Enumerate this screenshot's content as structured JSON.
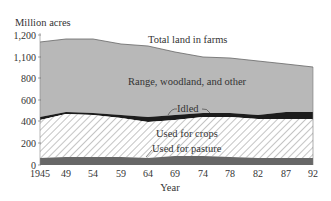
{
  "chart_data": {
    "type": "area",
    "stacked": true,
    "title": "",
    "ylabel": "Million acres",
    "xlabel": "Year",
    "x": [
      "1945",
      "49",
      "54",
      "59",
      "64",
      "69",
      "74",
      "78",
      "82",
      "87",
      "92"
    ],
    "yticks": [
      "0",
      "200",
      "400",
      "600",
      "800",
      "1,100",
      "1,200"
    ],
    "ylim": [
      0,
      1200
    ],
    "axis_note": "y-axis tick spacing is uniform although labels jump from 800 to 1,100",
    "series": [
      {
        "name": "Used for pasture",
        "values": [
          60,
          70,
          70,
          68,
          65,
          75,
          75,
          68,
          65,
          65,
          65
        ],
        "color": "#666666"
      },
      {
        "name": "Used for crops",
        "values": [
          360,
          400,
          395,
          385,
          370,
          365,
          370,
          395,
          380,
          340,
          345
        ],
        "color": "hatch"
      },
      {
        "name": "Idled",
        "values": [
          25,
          15,
          20,
          25,
          35,
          35,
          20,
          15,
          25,
          50,
          45
        ],
        "color": "#1a1a1a"
      },
      {
        "name": "Range, woodland, and other",
        "values": [
          0,
          0,
          0,
          0,
          0,
          0,
          0,
          0,
          0,
          0,
          0
        ],
        "color": "#b5b5b5"
      }
    ],
    "total_land_in_farms": [
      1165,
      1185,
      1185,
      1160,
      1150,
      1110,
      1080,
      1075,
      1050,
      1030,
      1000
    ],
    "annotations": [
      "Total land in farms",
      "Range, woodland, and other",
      "Idled",
      "Used for crops",
      "Used for pasture"
    ],
    "legend": "inline labels",
    "grid": false
  },
  "labels": {
    "ylabel": "Million acres",
    "xlabel": "Year",
    "total": "Total land in farms",
    "range": "Range, woodland, and other",
    "idled": "Idled",
    "crops": "Used for crops",
    "pasture": "Used for pasture"
  },
  "pixel_layout": {
    "x_px": [
      40,
      66,
      93,
      121,
      148,
      175,
      203,
      230,
      258,
      286,
      313
    ],
    "ytick_px": [
      165,
      143,
      121,
      100,
      78,
      57,
      35
    ],
    "top_px": [
      42,
      39,
      39,
      44,
      46,
      52,
      57,
      58,
      61,
      64,
      67
    ],
    "idle_top_px": [
      117,
      112,
      113,
      115,
      117,
      115,
      113,
      113,
      115,
      112,
      112
    ],
    "crop_top_px": [
      120,
      114,
      115,
      118,
      122,
      120,
      117,
      117,
      119,
      119,
      119
    ],
    "pasture_top_px": [
      158,
      157,
      157,
      157,
      158,
      156,
      156,
      157,
      158,
      158,
      158
    ]
  }
}
